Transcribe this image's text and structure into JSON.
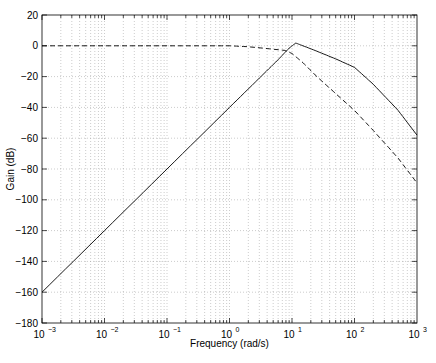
{
  "chart_data": {
    "type": "line",
    "title": "",
    "xlabel": "Frequency (rad/s)",
    "ylabel": "Gain (dB)",
    "xscale": "log",
    "xlim": [
      0.001,
      1000
    ],
    "ylim": [
      -180,
      20
    ],
    "grid": true,
    "legend": null,
    "x_ticks": [
      0.001,
      0.01,
      0.1,
      1,
      10,
      100,
      1000
    ],
    "x_tick_labels": [
      {
        "base": "10",
        "exp": "−3"
      },
      {
        "base": "10",
        "exp": "−2"
      },
      {
        "base": "10",
        "exp": "−1"
      },
      {
        "base": "10",
        "exp": "0"
      },
      {
        "base": "10",
        "exp": "1"
      },
      {
        "base": "10",
        "exp": "2"
      },
      {
        "base": "10",
        "exp": "3"
      }
    ],
    "y_ticks": [
      20,
      0,
      -20,
      -40,
      -60,
      -80,
      -100,
      -120,
      -140,
      -160,
      -180
    ],
    "y_tick_labels": [
      "20",
      "0",
      "−20",
      "−40",
      "−60",
      "−80",
      "−100",
      "−120",
      "−140",
      "−160",
      "−180"
    ],
    "series": [
      {
        "name": "solid",
        "style": "solid",
        "x": [
          0.001,
          0.01,
          0.1,
          1,
          3,
          6,
          9,
          11.5,
          15,
          25,
          50,
          100,
          200,
          500,
          1000
        ],
        "y": [
          -160,
          -120,
          -80,
          -40,
          -21,
          -9,
          -1.5,
          1.8,
          0,
          -3.5,
          -8.5,
          -14,
          -25,
          -42,
          -58
        ]
      },
      {
        "name": "dashed",
        "style": "dashed",
        "x": [
          0.001,
          0.01,
          0.1,
          1,
          2,
          4,
          7.7,
          10,
          15,
          25,
          50,
          100,
          200,
          500,
          1000
        ],
        "y": [
          0,
          0,
          0,
          0,
          -0.6,
          -1.8,
          -3,
          -5,
          -11,
          -20,
          -31,
          -42,
          -55,
          -73,
          -89
        ]
      }
    ]
  },
  "axes": {
    "xlabel": "Frequency (rad/s)",
    "ylabel": "Gain (dB)"
  }
}
